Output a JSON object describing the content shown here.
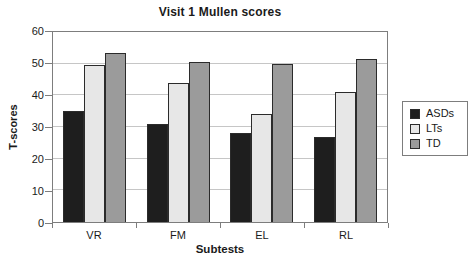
{
  "chart_data": {
    "type": "bar",
    "title": "Visit 1 Mullen scores",
    "xlabel": "Subtests",
    "ylabel": "T-scores",
    "categories": [
      "VR",
      "FM",
      "EL",
      "RL"
    ],
    "series": [
      {
        "name": "ASDs",
        "color": "#1e1e1e",
        "values": [
          35,
          31,
          28,
          27
        ]
      },
      {
        "name": "LTs",
        "color": "#e7e7e7",
        "values": [
          49.5,
          44,
          34,
          41
        ]
      },
      {
        "name": "TD",
        "color": "#9b9b9b",
        "values": [
          53.5,
          50.5,
          50,
          51.5
        ]
      }
    ],
    "ylim": [
      0,
      60
    ],
    "yticks": [
      0,
      10,
      20,
      30,
      40,
      50,
      60
    ],
    "grid": true,
    "legend_position": "right",
    "axis_color": "#7d7d7d",
    "gridline_color": "#c6c6c6",
    "bar_border_color": "#2b2b2b"
  }
}
